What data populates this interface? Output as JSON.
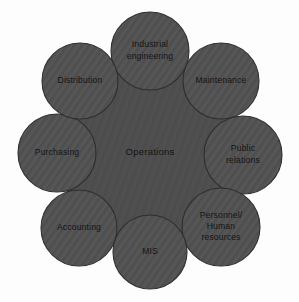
{
  "diagram": {
    "type": "hub-and-spoke",
    "background_color": "#fdfdfd",
    "hub": {
      "label": "Operations",
      "cx": 150,
      "cy": 152,
      "radius": 92,
      "fill_color": "#4e4e4e",
      "stroke_color": "#3c3c3c",
      "text_color": "#141414"
    },
    "node_style": {
      "fill_color": "#535353",
      "stroke_color": "#2e2e2e",
      "text_color": "#141414",
      "radius": 39
    },
    "nodes": [
      {
        "id": "industrial-engineering",
        "label": "Industrial engineering",
        "lines": [
          "Industrial",
          "engineering"
        ],
        "cx": 150,
        "cy": 51,
        "r": 39,
        "angle_deg": 270
      },
      {
        "id": "maintenance",
        "label": "Maintenance",
        "lines": [
          "Maintenance"
        ],
        "cx": 221,
        "cy": 81,
        "r": 38,
        "angle_deg": 315
      },
      {
        "id": "public-relations",
        "label": "Public relations",
        "lines": [
          "Public",
          "relations"
        ],
        "cx": 243,
        "cy": 155,
        "r": 39,
        "angle_deg": 0
      },
      {
        "id": "personnel-human-resources",
        "label": "Personnel/ Human resources",
        "lines": [
          "Personnel/",
          "Human",
          "resources"
        ],
        "cx": 221,
        "cy": 227,
        "r": 39,
        "angle_deg": 45
      },
      {
        "id": "mis",
        "label": "MIS",
        "lines": [
          "MIS"
        ],
        "cx": 150,
        "cy": 252,
        "r": 37,
        "angle_deg": 90
      },
      {
        "id": "accounting",
        "label": "Accounting",
        "lines": [
          "Accounting"
        ],
        "cx": 79,
        "cy": 228,
        "r": 38,
        "angle_deg": 135
      },
      {
        "id": "purchasing",
        "label": "Purchasing",
        "lines": [
          "Purchasing"
        ],
        "cx": 57,
        "cy": 153,
        "r": 39,
        "angle_deg": 180
      },
      {
        "id": "distribution",
        "label": "Distribution",
        "lines": [
          "Distribution"
        ],
        "cx": 80,
        "cy": 81,
        "r": 38,
        "angle_deg": 225
      }
    ]
  }
}
